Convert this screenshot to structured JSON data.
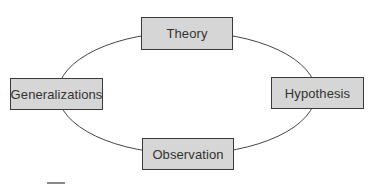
{
  "diagram": {
    "type": "cycle",
    "colors": {
      "background": "#ffffff",
      "node_fill": "#d6d6d6",
      "node_border": "#3a3a3a",
      "text": "#333333",
      "connector": "#444444"
    },
    "nodes": [
      {
        "id": "theory",
        "label": "Theory",
        "position": "top"
      },
      {
        "id": "hypothesis",
        "label": "Hypothesis",
        "position": "right"
      },
      {
        "id": "observation",
        "label": "Observation",
        "position": "bottom"
      },
      {
        "id": "generalizations",
        "label": "Generalizations",
        "position": "left"
      }
    ],
    "edges": [
      {
        "from": "theory",
        "to": "hypothesis"
      },
      {
        "from": "hypothesis",
        "to": "observation"
      },
      {
        "from": "observation",
        "to": "generalizations"
      },
      {
        "from": "generalizations",
        "to": "theory"
      }
    ]
  }
}
